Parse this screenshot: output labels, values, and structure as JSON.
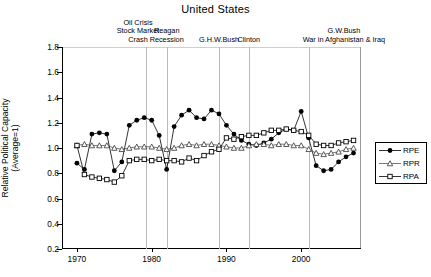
{
  "chart": {
    "title": "United States",
    "ylabel_line1": "Relative Political Capacity",
    "ylabel_line2": "(Average=1)"
  },
  "annotations": [
    {
      "id": "oil-crisis",
      "text_lines": [
        "Oil Crisis",
        "Stock Market",
        "Crash"
      ],
      "year": 1979.2
    },
    {
      "id": "reagan-recession",
      "text_lines": [
        "Reagan",
        "Recession"
      ],
      "year": 1982.0
    },
    {
      "id": "ghw-bush",
      "text_lines": [
        "G.H.W.Bush"
      ],
      "year": 1989.0
    },
    {
      "id": "clinton",
      "text_lines": [
        "Clinton"
      ],
      "year": 1993.0
    },
    {
      "id": "gw-bush",
      "text_lines": [
        "G.W.Bush",
        "War in Afghanistan & Iraq"
      ],
      "year": 2001.0
    }
  ],
  "legend": [
    {
      "key": "RPE",
      "label": "RPE",
      "marker": "filled-circle"
    },
    {
      "key": "RPR",
      "label": "RPR",
      "marker": "triangle"
    },
    {
      "key": "RPA",
      "label": "RPA",
      "marker": "open-square"
    }
  ],
  "chart_data": {
    "type": "line",
    "title": "United States",
    "xlabel": "",
    "ylabel": "Relative Political Capacity (Average=1)",
    "xlim": [
      1968,
      2008
    ],
    "ylim": [
      0.2,
      1.8
    ],
    "yticks": [
      0.2,
      0.4,
      0.6,
      0.8,
      1.0,
      1.2,
      1.4,
      1.6,
      1.8
    ],
    "xticks": [
      1970,
      1980,
      1990,
      2000
    ],
    "xticklabels": [
      "1970",
      "1980",
      "1990",
      "2000"
    ],
    "grid": false,
    "legend_position": "right",
    "x": [
      1970,
      1971,
      1972,
      1973,
      1974,
      1975,
      1976,
      1977,
      1978,
      1979,
      1980,
      1981,
      1982,
      1983,
      1984,
      1985,
      1986,
      1987,
      1988,
      1989,
      1990,
      1991,
      1992,
      1993,
      1994,
      1995,
      1996,
      1997,
      1998,
      1999,
      2000,
      2001,
      2002,
      2003,
      2004,
      2005,
      2006,
      2007
    ],
    "series": [
      {
        "name": "RPE",
        "marker": "filled-circle",
        "values": [
          0.88,
          0.83,
          1.11,
          1.12,
          1.11,
          0.82,
          0.89,
          1.18,
          1.22,
          1.24,
          1.22,
          1.1,
          0.83,
          1.17,
          1.26,
          1.3,
          1.24,
          1.23,
          1.3,
          1.27,
          1.18,
          1.11,
          1.06,
          1.03,
          1.02,
          1.04,
          1.07,
          1.12,
          1.15,
          1.14,
          1.29,
          1.08,
          0.86,
          0.82,
          0.83,
          0.89,
          0.93,
          0.96
        ]
      },
      {
        "name": "RPR",
        "marker": "triangle",
        "values": [
          1.02,
          1.03,
          1.02,
          1.02,
          1.02,
          1.0,
          0.99,
          1.0,
          1.01,
          1.01,
          1.01,
          1.0,
          0.99,
          1.0,
          1.02,
          1.03,
          1.02,
          1.03,
          1.03,
          1.02,
          1.01,
          1.0,
          1.0,
          1.02,
          1.03,
          1.03,
          1.02,
          1.03,
          1.03,
          1.02,
          1.02,
          0.99,
          0.96,
          0.95,
          0.96,
          0.97,
          0.99,
          1.0
        ]
      },
      {
        "name": "RPA",
        "marker": "open-square",
        "values": [
          1.02,
          0.79,
          0.77,
          0.76,
          0.75,
          0.73,
          0.78,
          0.9,
          0.91,
          0.91,
          0.9,
          0.91,
          0.9,
          0.9,
          0.89,
          0.92,
          0.9,
          0.94,
          0.97,
          0.99,
          1.08,
          1.07,
          1.09,
          1.1,
          1.1,
          1.12,
          1.14,
          1.14,
          1.15,
          1.14,
          1.13,
          1.1,
          1.03,
          1.02,
          1.02,
          1.04,
          1.05,
          1.06
        ]
      }
    ]
  }
}
